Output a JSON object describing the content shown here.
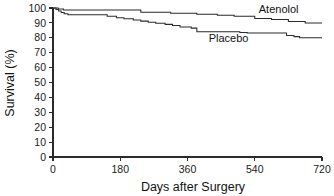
{
  "chart_data": {
    "type": "line",
    "title": "",
    "subtitle": "",
    "xlabel": "Days after Surgery",
    "ylabel": "Survival (%)",
    "xlim": [
      0,
      720
    ],
    "ylim": [
      0,
      100
    ],
    "xticks": [
      0,
      180,
      360,
      540,
      720
    ],
    "xtick_labels": [
      "0",
      "180",
      "360",
      "540",
      "720"
    ],
    "yticks": [
      0,
      10,
      20,
      30,
      40,
      50,
      60,
      70,
      80,
      90,
      100
    ],
    "ytick_labels": [
      "0",
      "10",
      "20",
      "30",
      "40",
      "50",
      "60",
      "70",
      "80",
      "90",
      "100"
    ],
    "grid": false,
    "legend_position": "inline-annotation",
    "step_style": "post",
    "line_color": "#2b2b2b",
    "series": [
      {
        "name": "Atenolol",
        "label_x": 604,
        "label_y": 96.5,
        "x": [
          0,
          8,
          14,
          20,
          28,
          40,
          150,
          160,
          225,
          235,
          300,
          315,
          370,
          385,
          420,
          440,
          470,
          485,
          520,
          540,
          565,
          585,
          615,
          630,
          660,
          675,
          720
        ],
        "y": [
          100,
          100,
          99.3,
          99.3,
          98.6,
          98.6,
          98.6,
          98.6,
          98.6,
          97.2,
          97.2,
          96.5,
          96.5,
          95.8,
          95.8,
          95.1,
          95.1,
          94.4,
          94.4,
          93.0,
          93.0,
          92.3,
          92.3,
          91.0,
          91.0,
          90.0,
          90.0
        ]
      },
      {
        "name": "Placebo",
        "label_x": 470,
        "label_y": 77.5,
        "x": [
          0,
          8,
          15,
          22,
          30,
          40,
          55,
          130,
          145,
          170,
          190,
          215,
          235,
          255,
          275,
          300,
          320,
          340,
          355,
          370,
          385,
          400,
          480,
          500,
          520,
          610,
          625,
          645,
          660,
          720
        ],
        "y": [
          100,
          99.0,
          98.0,
          97.0,
          96.2,
          95.5,
          95.5,
          95.5,
          94.5,
          93.5,
          92.8,
          92.0,
          91.2,
          90.5,
          89.8,
          89.0,
          88.2,
          87.3,
          87.3,
          86.5,
          84.0,
          84.0,
          84.0,
          83.5,
          83.2,
          83.2,
          81.5,
          80.8,
          80.0,
          80.0
        ]
      }
    ]
  },
  "axes": {
    "x_title": "Days after Surgery",
    "y_title": "Survival (%)"
  }
}
